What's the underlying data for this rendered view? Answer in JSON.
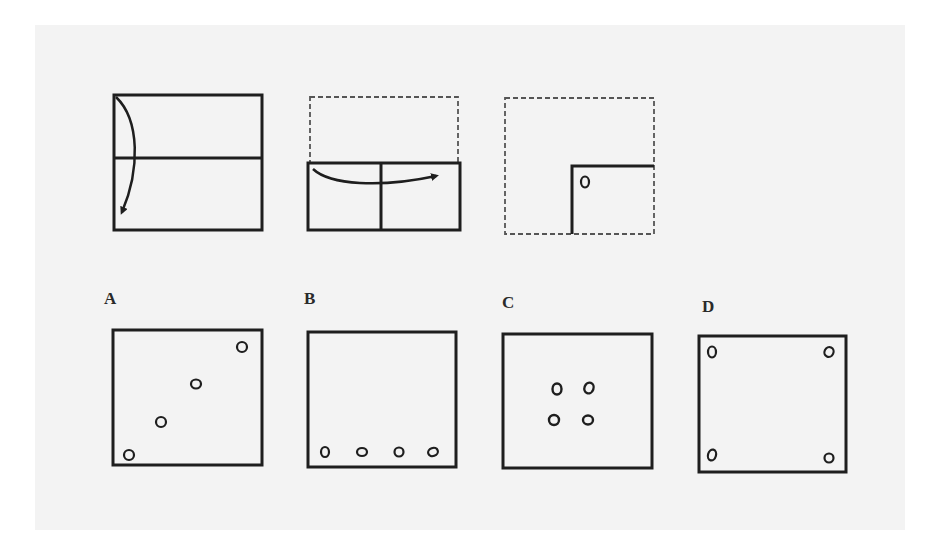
{
  "figure": {
    "type": "paper-folding-punch-puzzle",
    "steps": [
      {
        "id": "step-1",
        "description": "Square sheet folded top half down along horizontal midline",
        "arrow": "down"
      },
      {
        "id": "step-2",
        "description": "Folded rectangle folded left half over to right along vertical line",
        "arrow": "right"
      },
      {
        "id": "step-3",
        "description": "Quarter-folded sheet in bottom-right with a single hole punched near the fold corner",
        "holes": 1
      }
    ],
    "options": [
      {
        "label": "A",
        "holes": 4,
        "pattern": "diagonal from bottom-left to top-right"
      },
      {
        "label": "B",
        "holes": 4,
        "pattern": "row along bottom edge"
      },
      {
        "label": "C",
        "holes": 4,
        "pattern": "2x2 cluster at center"
      },
      {
        "label": "D",
        "holes": 4,
        "pattern": "one at each corner"
      }
    ]
  },
  "colors": {
    "ink": "#1e1e1e",
    "paper": "#f3f3f3",
    "page": "#ffffff"
  }
}
